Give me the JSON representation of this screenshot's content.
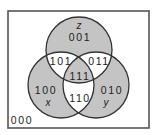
{
  "diagram": {
    "type": "venn-3-set",
    "sets": [
      {
        "name": "x",
        "label": "x"
      },
      {
        "name": "y",
        "label": "y"
      },
      {
        "name": "z",
        "label": "z"
      }
    ],
    "regions": {
      "outside": "000",
      "x_only": "100",
      "y_only": "010",
      "z_only": "001",
      "xz": "101",
      "yz": "011",
      "xy": "110",
      "xyz": "111"
    },
    "shaded_regions": [
      "100",
      "010",
      "001",
      "111"
    ],
    "colors": {
      "shade": "#c4c4c4",
      "unshaded": "#ffffff",
      "stroke": "#333333",
      "frame": "#555555"
    }
  }
}
